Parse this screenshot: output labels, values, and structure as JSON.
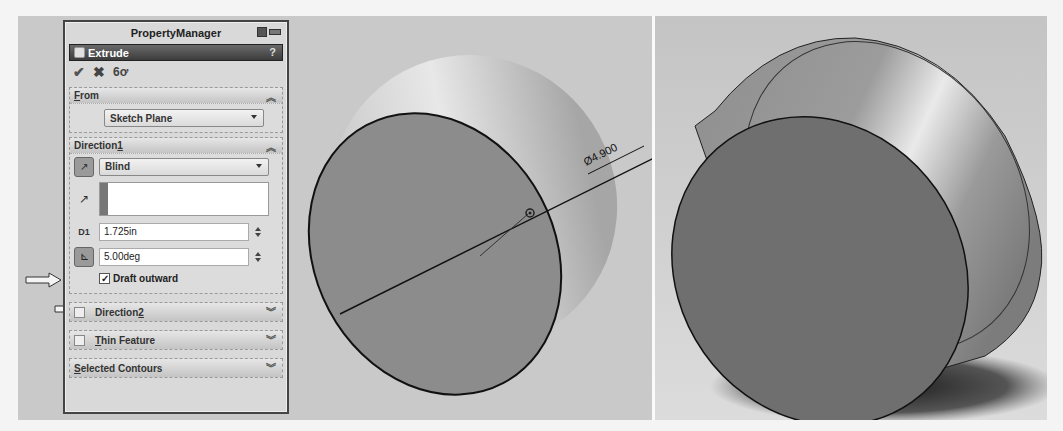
{
  "property_manager": {
    "title": "PropertyManager",
    "feature": {
      "name": "Extrude",
      "help": "?"
    },
    "actions": {
      "ok": "✔",
      "cancel": "✖",
      "preview": "6ơ"
    },
    "from": {
      "header": "From",
      "header_mnemonic": "F",
      "header_rest": "rom",
      "start_condition": "Sketch Plane"
    },
    "direction1": {
      "header": "Direction 1",
      "header_prefix": "Direction ",
      "header_mnemonic": "1",
      "end_condition": "Blind",
      "depth": "1.725in",
      "draft_angle": "5.00deg",
      "draft_outward_label": "Draft outward",
      "draft_outward_checked": true
    },
    "direction2": {
      "header_prefix": "Direction ",
      "header_mnemonic": "2"
    },
    "thin_feature": {
      "header_mnemonic": "T",
      "header_rest": "hin Feature"
    },
    "selected_contours": {
      "header_mnemonic": "S",
      "header_rest": "elected Contours"
    },
    "expand_icon": "≫",
    "collapse_icon": "≪"
  },
  "graphics": {
    "dimension_label": "Ø4.900",
    "left_view": "draft preview (extrude with draft, shaded)",
    "right_view": "final extruded cylinder (shaded)"
  },
  "colors": {
    "panel_bg": "#d9d9d9",
    "feature_bar": "#4a4a4a",
    "viewport_bg": "#c9c9c9",
    "face_dark": "#7a7a7a",
    "face_light": "#d8d8d8"
  }
}
